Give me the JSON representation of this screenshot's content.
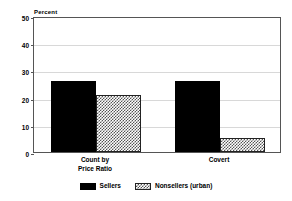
{
  "chart_data": {
    "type": "bar",
    "title": "",
    "subtitle": "",
    "xlabel": "",
    "ylabel": "Percent",
    "ylim": [
      0,
      50
    ],
    "yticks": [
      0,
      10,
      20,
      30,
      40,
      50
    ],
    "ytick_labels": [
      "0",
      "10",
      "20",
      "30",
      "40",
      "50"
    ],
    "grid": true,
    "grid_axis": "y",
    "legend_position": "bottom-center",
    "categories": [
      "Count by\nPrice Ratio",
      "Covert"
    ],
    "category_lines": [
      [
        "Count by",
        "Price Ratio"
      ],
      [
        "Covert"
      ]
    ],
    "series": [
      {
        "name": "Sellers",
        "fill": "solid-black",
        "color": "#000000",
        "values": [
          26,
          26
        ]
      },
      {
        "name": "Nonsellers (urban)",
        "fill": "checkered-hatch",
        "color": "#555555",
        "values": [
          21,
          5
        ]
      }
    ]
  },
  "legend": {
    "items": [
      {
        "label": "Sellers"
      },
      {
        "label": "Nonsellers (urban)"
      }
    ]
  }
}
